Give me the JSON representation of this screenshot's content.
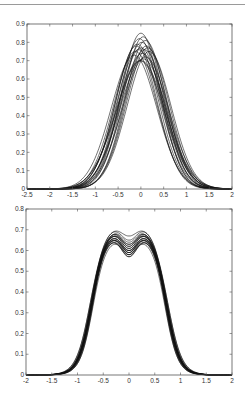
{
  "chart_data": [
    {
      "type": "line",
      "title": "",
      "xlabel": "",
      "ylabel": "",
      "xlim": [
        -2.5,
        2
      ],
      "ylim": [
        0,
        0.9
      ],
      "xticks": [
        "-2.5",
        "-2",
        "-1.5",
        "-1",
        "-0.5",
        "0",
        "0.5",
        "1",
        "1.5",
        "2"
      ],
      "yticks": [
        "0",
        "0.1",
        "0.2",
        "0.3",
        "0.4",
        "0.5",
        "0.6",
        "0.7",
        "0.8",
        "0.9"
      ],
      "grid": false,
      "legend": null,
      "description": "Overlay of ~20 unimodal density curves centered near x=0",
      "series_model": "gaussian",
      "series": [
        {
          "name": "curve-1",
          "peak": 0.85,
          "center": 0.0,
          "sigma": 0.44
        },
        {
          "name": "curve-2",
          "peak": 0.83,
          "center": 0.05,
          "sigma": 0.45
        },
        {
          "name": "curve-3",
          "peak": 0.82,
          "center": -0.03,
          "sigma": 0.46
        },
        {
          "name": "curve-4",
          "peak": 0.81,
          "center": 0.1,
          "sigma": 0.45
        },
        {
          "name": "curve-5",
          "peak": 0.8,
          "center": 0.02,
          "sigma": 0.47
        },
        {
          "name": "curve-6",
          "peak": 0.79,
          "center": -0.08,
          "sigma": 0.47
        },
        {
          "name": "curve-7",
          "peak": 0.78,
          "center": 0.12,
          "sigma": 0.46
        },
        {
          "name": "curve-8",
          "peak": 0.77,
          "center": 0.0,
          "sigma": 0.48
        },
        {
          "name": "curve-9",
          "peak": 0.77,
          "center": 0.15,
          "sigma": 0.47
        },
        {
          "name": "curve-10",
          "peak": 0.76,
          "center": -0.05,
          "sigma": 0.49
        },
        {
          "name": "curve-11",
          "peak": 0.76,
          "center": 0.08,
          "sigma": 0.48
        },
        {
          "name": "curve-12",
          "peak": 0.75,
          "center": -0.12,
          "sigma": 0.48
        },
        {
          "name": "curve-13",
          "peak": 0.75,
          "center": 0.18,
          "sigma": 0.48
        },
        {
          "name": "curve-14",
          "peak": 0.74,
          "center": 0.03,
          "sigma": 0.5
        },
        {
          "name": "curve-15",
          "peak": 0.73,
          "center": -0.15,
          "sigma": 0.5
        },
        {
          "name": "curve-16",
          "peak": 0.72,
          "center": 0.1,
          "sigma": 0.51
        },
        {
          "name": "curve-17",
          "peak": 0.71,
          "center": 0.05,
          "sigma": 0.52
        },
        {
          "name": "curve-18",
          "peak": 0.7,
          "center": -0.02,
          "sigma": 0.53
        },
        {
          "name": "curve-19",
          "peak": 0.7,
          "center": 0.0,
          "sigma": 0.54
        },
        {
          "name": "curve-20",
          "peak": 0.78,
          "center": -0.1,
          "sigma": 0.46
        }
      ]
    },
    {
      "type": "line",
      "title": "",
      "xlabel": "",
      "ylabel": "",
      "xlim": [
        -2,
        2
      ],
      "ylim": [
        0,
        0.8
      ],
      "xticks": [
        "-2",
        "-1.5",
        "-1",
        "-0.5",
        "0",
        "0.5",
        "1",
        "1.5",
        "2"
      ],
      "yticks": [
        "0",
        "0.1",
        "0.2",
        "0.3",
        "0.4",
        "0.5",
        "0.6",
        "0.7",
        "0.8"
      ],
      "grid": false,
      "legend": null,
      "description": "Overlay of ~20 bimodal density curves with peaks near x=±0.3 and a dip at x=0",
      "series_model": "bimodal",
      "series": [
        {
          "name": "curve-1",
          "peak": 0.71,
          "dip": 0.66,
          "spread": 1.0
        },
        {
          "name": "curve-2",
          "peak": 0.71,
          "dip": 0.64,
          "spread": 1.01
        },
        {
          "name": "curve-3",
          "peak": 0.7,
          "dip": 0.62,
          "spread": 0.99
        },
        {
          "name": "curve-4",
          "peak": 0.7,
          "dip": 0.61,
          "spread": 1.0
        },
        {
          "name": "curve-5",
          "peak": 0.69,
          "dip": 0.61,
          "spread": 0.98
        },
        {
          "name": "curve-6",
          "peak": 0.69,
          "dip": 0.6,
          "spread": 1.0
        },
        {
          "name": "curve-7",
          "peak": 0.69,
          "dip": 0.6,
          "spread": 1.02
        },
        {
          "name": "curve-8",
          "peak": 0.68,
          "dip": 0.59,
          "spread": 0.99
        },
        {
          "name": "curve-9",
          "peak": 0.68,
          "dip": 0.59,
          "spread": 1.01
        },
        {
          "name": "curve-10",
          "peak": 0.68,
          "dip": 0.58,
          "spread": 1.0
        },
        {
          "name": "curve-11",
          "peak": 0.67,
          "dip": 0.58,
          "spread": 0.98
        },
        {
          "name": "curve-12",
          "peak": 0.67,
          "dip": 0.58,
          "spread": 1.02
        },
        {
          "name": "curve-13",
          "peak": 0.67,
          "dip": 0.57,
          "spread": 1.0
        },
        {
          "name": "curve-14",
          "peak": 0.66,
          "dip": 0.57,
          "spread": 0.99
        },
        {
          "name": "curve-15",
          "peak": 0.66,
          "dip": 0.56,
          "spread": 1.01
        },
        {
          "name": "curve-16",
          "peak": 0.66,
          "dip": 0.56,
          "spread": 1.03
        },
        {
          "name": "curve-17",
          "peak": 0.65,
          "dip": 0.57,
          "spread": 0.97
        },
        {
          "name": "curve-18",
          "peak": 0.69,
          "dip": 0.62,
          "spread": 1.04
        },
        {
          "name": "curve-19",
          "peak": 0.7,
          "dip": 0.63,
          "spread": 0.96
        },
        {
          "name": "curve-20",
          "peak": 0.67,
          "dip": 0.59,
          "spread": 1.05
        }
      ]
    }
  ],
  "layout": {
    "panels": [
      {
        "left": 27,
        "top": 24,
        "right": 232,
        "bottom": 189
      },
      {
        "left": 26,
        "top": 209,
        "right": 232,
        "bottom": 375
      }
    ]
  }
}
